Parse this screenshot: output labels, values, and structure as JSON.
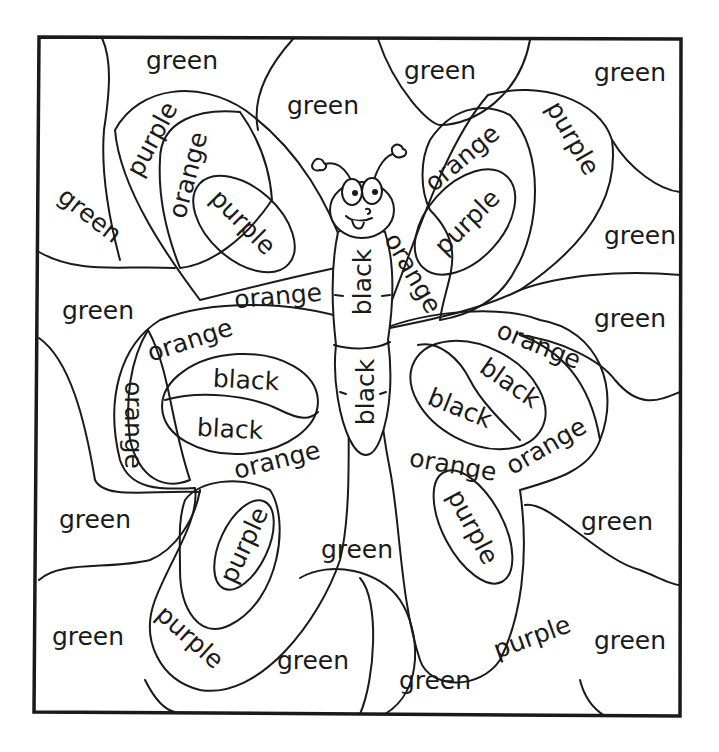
{
  "worksheet": {
    "title": "Color-by-word butterfly",
    "colors": {
      "green": "#2e9e3a",
      "purple": "#7b3fa0",
      "orange": "#f08a1c",
      "black": "#1a1a1a"
    },
    "labels": [
      {
        "id": "g1",
        "text": "green",
        "x": 182,
        "y": 60,
        "rot": 0
      },
      {
        "id": "g2",
        "text": "green",
        "x": 440,
        "y": 70,
        "rot": 0
      },
      {
        "id": "g3",
        "text": "green",
        "x": 630,
        "y": 72,
        "rot": 0
      },
      {
        "id": "g4",
        "text": "green",
        "x": 323,
        "y": 105,
        "rot": 0
      },
      {
        "id": "g5",
        "text": "green",
        "x": 90,
        "y": 215,
        "rot": 38
      },
      {
        "id": "g6",
        "text": "green",
        "x": 640,
        "y": 235,
        "rot": 0
      },
      {
        "id": "g7",
        "text": "green",
        "x": 98,
        "y": 310,
        "rot": 0
      },
      {
        "id": "g8",
        "text": "green",
        "x": 630,
        "y": 318,
        "rot": 0
      },
      {
        "id": "g9",
        "text": "green",
        "x": 95,
        "y": 519,
        "rot": 0
      },
      {
        "id": "g10",
        "text": "green",
        "x": 617,
        "y": 521,
        "rot": 0
      },
      {
        "id": "g11",
        "text": "green",
        "x": 357,
        "y": 549,
        "rot": 0
      },
      {
        "id": "g12",
        "text": "green",
        "x": 88,
        "y": 636,
        "rot": 0
      },
      {
        "id": "g13",
        "text": "green",
        "x": 630,
        "y": 640,
        "rot": 0
      },
      {
        "id": "g14",
        "text": "green",
        "x": 313,
        "y": 660,
        "rot": 0
      },
      {
        "id": "g15",
        "text": "green",
        "x": 435,
        "y": 680,
        "rot": 0
      },
      {
        "id": "p1",
        "text": "purple",
        "x": 152,
        "y": 139,
        "rot": -62
      },
      {
        "id": "p2",
        "text": "purple",
        "x": 573,
        "y": 138,
        "rot": 60
      },
      {
        "id": "p3",
        "text": "purple",
        "x": 243,
        "y": 222,
        "rot": 45
      },
      {
        "id": "p4",
        "text": "purple",
        "x": 467,
        "y": 222,
        "rot": -45
      },
      {
        "id": "p5",
        "text": "purple",
        "x": 244,
        "y": 545,
        "rot": -65
      },
      {
        "id": "p6",
        "text": "purple",
        "x": 473,
        "y": 527,
        "rot": 62
      },
      {
        "id": "p7",
        "text": "purple",
        "x": 190,
        "y": 637,
        "rot": 42
      },
      {
        "id": "p8",
        "text": "purple",
        "x": 532,
        "y": 637,
        "rot": -20
      },
      {
        "id": "o1",
        "text": "orange",
        "x": 188,
        "y": 175,
        "rot": -75
      },
      {
        "id": "o2",
        "text": "orange",
        "x": 462,
        "y": 158,
        "rot": -40
      },
      {
        "id": "o3",
        "text": "orange",
        "x": 413,
        "y": 273,
        "rot": 60
      },
      {
        "id": "o4",
        "text": "orange",
        "x": 278,
        "y": 296,
        "rot": -5
      },
      {
        "id": "o5",
        "text": "orange",
        "x": 190,
        "y": 340,
        "rot": -18
      },
      {
        "id": "o6",
        "text": "orange",
        "x": 539,
        "y": 345,
        "rot": 22
      },
      {
        "id": "o7",
        "text": "orange",
        "x": 133,
        "y": 425,
        "rot": 90
      },
      {
        "id": "o8",
        "text": "orange",
        "x": 277,
        "y": 460,
        "rot": -14
      },
      {
        "id": "o9",
        "text": "orange",
        "x": 453,
        "y": 465,
        "rot": 10
      },
      {
        "id": "o10",
        "text": "orange",
        "x": 546,
        "y": 446,
        "rot": -30
      },
      {
        "id": "b1",
        "text": "black",
        "x": 362,
        "y": 282,
        "rot": -90
      },
      {
        "id": "b2",
        "text": "black",
        "x": 365,
        "y": 392,
        "rot": -90
      },
      {
        "id": "b3",
        "text": "black",
        "x": 246,
        "y": 380,
        "rot": 3
      },
      {
        "id": "b4",
        "text": "black",
        "x": 230,
        "y": 429,
        "rot": 3
      },
      {
        "id": "b5",
        "text": "black",
        "x": 510,
        "y": 383,
        "rot": 35
      },
      {
        "id": "b6",
        "text": "black",
        "x": 460,
        "y": 408,
        "rot": 22
      }
    ]
  }
}
